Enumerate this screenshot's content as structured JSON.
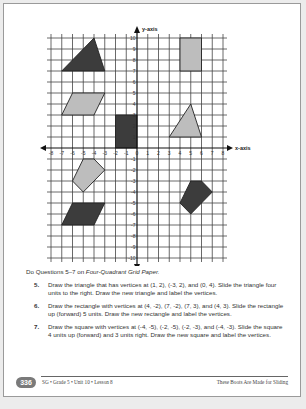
{
  "grid": {
    "x_axis_label": "x-axis",
    "y_axis_label": "y-axis",
    "x_range": [
      -8,
      8
    ],
    "y_range": [
      -10,
      10
    ],
    "x_tick_labels": [
      "-8",
      "-7",
      "-6",
      "-5",
      "-4",
      "-3",
      "-2",
      "-1",
      "0",
      "1",
      "2",
      "3",
      "4",
      "5",
      "6",
      "7",
      "8"
    ],
    "y_tick_labels": [
      "10",
      "9",
      "8",
      "7",
      "6",
      "5",
      "4",
      "3",
      "2",
      "1",
      "-1",
      "-2",
      "-3",
      "-4",
      "-5",
      "-6",
      "-7",
      "-8",
      "-9",
      "-10"
    ],
    "shapes": [
      {
        "name": "dark-triangle",
        "fill": "#3c3c3c",
        "points": [
          [
            -7,
            7
          ],
          [
            -4,
            10
          ],
          [
            -3,
            7
          ]
        ]
      },
      {
        "name": "gray-rectangle",
        "fill": "#bdbdbd",
        "points": [
          [
            4,
            10
          ],
          [
            6,
            10
          ],
          [
            6,
            7
          ],
          [
            4,
            7
          ]
        ]
      },
      {
        "name": "light-parallelogram",
        "fill": "#bdbdbd",
        "points": [
          [
            -6,
            5
          ],
          [
            -3,
            5
          ],
          [
            -4,
            3
          ],
          [
            -7,
            3
          ]
        ]
      },
      {
        "name": "dark-rectangle",
        "fill": "#3c3c3c",
        "points": [
          [
            -2,
            3
          ],
          [
            0,
            3
          ],
          [
            0,
            0
          ],
          [
            -2,
            0
          ]
        ]
      },
      {
        "name": "light-triangle",
        "fill": "#bdbdbd",
        "points": [
          [
            3,
            1
          ],
          [
            5,
            4
          ],
          [
            6,
            1
          ]
        ]
      },
      {
        "name": "light-pentagon",
        "fill": "#bdbdbd",
        "points": [
          [
            -5,
            -1
          ],
          [
            -4,
            -1
          ],
          [
            -3,
            -2
          ],
          [
            -5,
            -4
          ],
          [
            -6,
            -3
          ]
        ]
      },
      {
        "name": "dark-parallelogram",
        "fill": "#3c3c3c",
        "points": [
          [
            -6,
            -5
          ],
          [
            -3,
            -5
          ],
          [
            -4,
            -7
          ],
          [
            -7,
            -7
          ]
        ]
      },
      {
        "name": "dark-pentagon",
        "fill": "#3c3c3c",
        "points": [
          [
            5,
            -3
          ],
          [
            6,
            -3
          ],
          [
            7,
            -4
          ],
          [
            5,
            -6
          ],
          [
            4,
            -5
          ]
        ]
      }
    ]
  },
  "instructions": {
    "lead_prefix": "Do Questions 5–7 on ",
    "lead_italic": "Four-Quadrant Grid Paper.",
    "questions": [
      {
        "number": "5.",
        "text": "Draw the triangle that has vertices at (1, 2), (-3, 2), and (0, 4). Slide the triangle four units to the right. Draw the new triangle and label the vertices."
      },
      {
        "number": "6.",
        "text": "Draw the rectangle with vertices at (4, -2), (7, -2), (7, 3), and (4, 3). Slide the rectangle up (forward) 5 units. Draw the new rectangle and label the vertices."
      },
      {
        "number": "7.",
        "text": "Draw the square with vertices at (-4, -5), (-2, -5), (-2, -3), and (-4, -3). Slide the square 4 units up (forward) and 3 units right. Draw the new square and label the vertices."
      }
    ]
  },
  "footer": {
    "page_number": "336",
    "left": "SG • Grade 5 • Unit 10 • Lesson 8",
    "right": "These Boots Are Made for Sliding"
  }
}
